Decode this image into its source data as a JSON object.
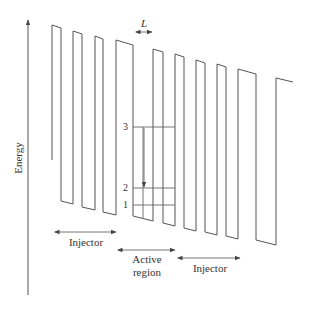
{
  "figure": {
    "type": "quantum-cascade-band-diagram",
    "axis_label": "Energy",
    "width_label": "L",
    "levels": [
      {
        "label": "3"
      },
      {
        "label": "2"
      },
      {
        "label": "1"
      }
    ],
    "regions": [
      {
        "name": "injector-left",
        "label": "Injector"
      },
      {
        "name": "active-region",
        "label_line1": "Active",
        "label_line2": "region"
      },
      {
        "name": "injector-right",
        "label": "Injector"
      }
    ],
    "colors": {
      "line": "#555555",
      "text": "#333333",
      "background": "#ffffff"
    }
  }
}
